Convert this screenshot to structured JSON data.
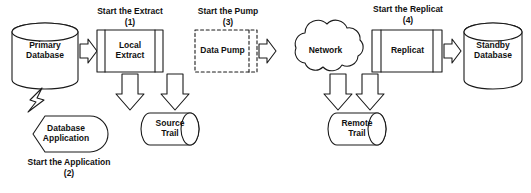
{
  "diagram": {
    "type": "flow-diagram",
    "colors": {
      "background": "#ffffff",
      "stroke": "#1a1a1a",
      "fill": "#ffffff",
      "text": "#111111"
    },
    "nodes": [
      {
        "id": "primary-database",
        "label": "Primary\nDatabase",
        "shape": "cylinder-vertical"
      },
      {
        "id": "local-extract",
        "label": "Local\nExtract",
        "shape": "process-box"
      },
      {
        "id": "source-trail",
        "label": "Source\nTrail",
        "shape": "cylinder-horizontal"
      },
      {
        "id": "data-pump",
        "label": "Data Pump",
        "shape": "process-box-dashed"
      },
      {
        "id": "network",
        "label": "Network",
        "shape": "cloud"
      },
      {
        "id": "remote-trail",
        "label": "Remote\nTrail",
        "shape": "cylinder-horizontal"
      },
      {
        "id": "replicat",
        "label": "Replicat",
        "shape": "process-box"
      },
      {
        "id": "standby-database",
        "label": "Standby\nDatabase",
        "shape": "cylinder-vertical"
      },
      {
        "id": "database-application",
        "label": "Database\nApplication",
        "shape": "hexagon-round"
      }
    ],
    "steps": [
      {
        "id": "step-extract",
        "label": "Start the Extract",
        "number": "(1)"
      },
      {
        "id": "step-application",
        "label": "Start the Application",
        "number": "(2)"
      },
      {
        "id": "step-pump",
        "label": "Start the Pump",
        "number": "(3)"
      },
      {
        "id": "step-replicat",
        "label": "Start the Replicat",
        "number": "(4)"
      }
    ],
    "connectors": [
      {
        "id": "primary-to-extract",
        "kind": "block-arrow",
        "direction": "right"
      },
      {
        "id": "extract-to-source-trail",
        "kind": "block-arrow",
        "direction": "down"
      },
      {
        "id": "source-trail-to-pump",
        "kind": "block-arrow",
        "direction": "up"
      },
      {
        "id": "pump-to-network",
        "kind": "block-arrow",
        "direction": "right"
      },
      {
        "id": "network-to-remote-trail",
        "kind": "block-arrow",
        "direction": "down"
      },
      {
        "id": "remote-trail-to-replicat",
        "kind": "block-arrow",
        "direction": "up"
      },
      {
        "id": "replicat-to-standby",
        "kind": "block-arrow",
        "direction": "right"
      },
      {
        "id": "application-to-primary",
        "kind": "lightning-bolt",
        "direction": "up"
      }
    ]
  }
}
